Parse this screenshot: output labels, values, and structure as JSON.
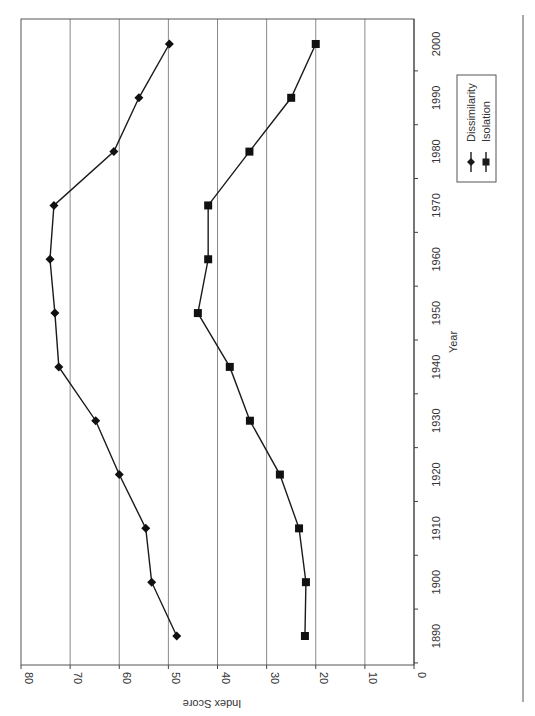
{
  "chart_data": {
    "type": "line",
    "orientation": "rotated 90° (page rotated; value axis runs horizontally at bottom, year axis vertically on right)",
    "title": "",
    "xlabel": "Year",
    "ylabel": "Index Score",
    "x": [
      1890,
      1900,
      1910,
      1920,
      1930,
      1940,
      1950,
      1960,
      1970,
      1980,
      1990,
      2000
    ],
    "x_ticks": [
      "1890",
      "1900",
      "1910",
      "1920",
      "1930",
      "1940",
      "1950",
      "1960",
      "1970",
      "1980",
      "1990",
      "2000"
    ],
    "y_ticks": [
      "0",
      "10",
      "20",
      "30",
      "40",
      "50",
      "60",
      "70",
      "80"
    ],
    "ylim": [
      0,
      80
    ],
    "grid": true,
    "legend_position": "right",
    "series": [
      {
        "name": "Dissimilarity",
        "marker": "diamond",
        "values": [
          48.3,
          53.4,
          54.6,
          60.0,
          64.8,
          72.3,
          73.1,
          74.1,
          73.3,
          61.1,
          56.0,
          49.8
        ]
      },
      {
        "name": "Isolation",
        "marker": "square",
        "values": [
          22.2,
          22.0,
          23.4,
          27.3,
          33.4,
          37.5,
          44.0,
          41.9,
          41.9,
          33.5,
          25.0,
          20.0
        ]
      }
    ]
  },
  "legend": {
    "items": [
      "Dissimilarity",
      "Isolation"
    ]
  }
}
